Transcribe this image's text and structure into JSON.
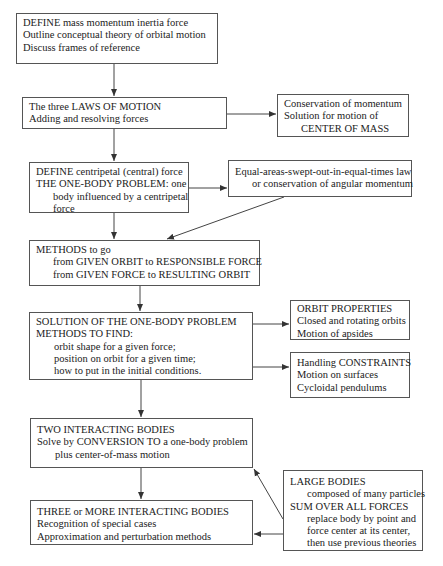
{
  "diagram": {
    "title": "",
    "nodes": [
      {
        "id": "define-mass",
        "lines": [
          "DEFINE mass momentum inertia force",
          "Outline conceptual theory of orbital motion",
          "Discuss frames of reference"
        ]
      },
      {
        "id": "laws-of-motion",
        "lines": [
          "The three LAWS OF MOTION",
          "Adding and resolving forces"
        ]
      },
      {
        "id": "center-of-mass",
        "lines": [
          "Conservation of momentum",
          "Solution for motion of",
          "CENTER OF MASS"
        ]
      },
      {
        "id": "centripetal-force",
        "lines": [
          "DEFINE centripetal (central) force",
          "THE ONE-BODY PROBLEM: one",
          "body influenced by a centripetal",
          "force"
        ]
      },
      {
        "id": "equal-areas",
        "lines": [
          "Equal-areas-swept-out-in-equal-times law",
          "or conservation of angular momentum"
        ]
      },
      {
        "id": "methods",
        "lines": [
          "METHODS to go",
          "from GIVEN ORBIT to RESPONSIBLE FORCE",
          "from GIVEN FORCE to RESULTING ORBIT"
        ]
      },
      {
        "id": "solution-one-body",
        "lines": [
          "SOLUTION OF THE ONE-BODY PROBLEM",
          "METHODS TO FIND:",
          "orbit shape for a given force;",
          "position on orbit for a given time;",
          "how to put in the initial conditions."
        ]
      },
      {
        "id": "orbit-properties",
        "lines": [
          "ORBIT PROPERTIES",
          "Closed and rotating orbits",
          "Motion of apsides"
        ]
      },
      {
        "id": "constraints",
        "lines": [
          "Handling CONSTRAINTS",
          "Motion on surfaces",
          "Cycloidal pendulums"
        ]
      },
      {
        "id": "two-bodies",
        "lines": [
          "TWO INTERACTING BODIES",
          "Solve by CONVERSION TO a one-body problem",
          "plus center-of-mass motion"
        ]
      },
      {
        "id": "large-bodies",
        "lines": [
          "LARGE BODIES",
          "composed of many particles",
          "SUM OVER ALL FORCES",
          "replace body by point and",
          "force center at its center,",
          "then use previous theories"
        ]
      },
      {
        "id": "three-bodies",
        "lines": [
          "THREE or MORE INTERACTING BODIES",
          "Recognition of special cases",
          "Approximation and perturbation methods"
        ]
      }
    ],
    "edges": [
      {
        "from": "define-mass",
        "to": "laws-of-motion"
      },
      {
        "from": "laws-of-motion",
        "to": "center-of-mass"
      },
      {
        "from": "laws-of-motion",
        "to": "centripetal-force"
      },
      {
        "from": "centripetal-force",
        "to": "equal-areas"
      },
      {
        "from": "centripetal-force",
        "to": "methods"
      },
      {
        "from": "equal-areas",
        "to": "methods"
      },
      {
        "from": "methods",
        "to": "solution-one-body"
      },
      {
        "from": "solution-one-body",
        "to": "orbit-properties"
      },
      {
        "from": "solution-one-body",
        "to": "constraints"
      },
      {
        "from": "solution-one-body",
        "to": "two-bodies"
      },
      {
        "from": "two-bodies",
        "to": "three-bodies"
      },
      {
        "from": "large-bodies",
        "to": "two-bodies"
      },
      {
        "from": "large-bodies",
        "to": "three-bodies"
      }
    ],
    "colors": {
      "line": "#444444",
      "border": "#555555",
      "text": "#222222",
      "background": "#ffffff"
    }
  }
}
